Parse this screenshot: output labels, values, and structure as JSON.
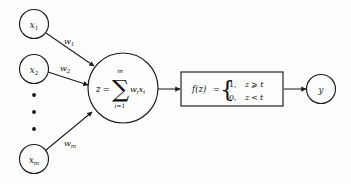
{
  "diagram": {
    "background_color": "#fdfdfd",
    "stroke_color": "#1b1b1b",
    "inputs": [
      {
        "label": "x",
        "subscript": "1",
        "weight": "w",
        "weight_subscript": "1"
      },
      {
        "label": "x",
        "subscript": "2",
        "weight": "w",
        "weight_subscript": "2"
      },
      {
        "label": "x",
        "subscript": "m",
        "weight": "w",
        "weight_subscript": "m"
      }
    ],
    "ellipsis": {
      "name": "vertical-ellipsis",
      "dot_count": 3
    },
    "summation": {
      "lhs": "z",
      "equals": "=",
      "sigma": "∑",
      "upper_limit": "m",
      "lower_limit": "i=1",
      "term_w": "w",
      "term_w_sub": "i",
      "term_x": "x",
      "term_x_sub": "i"
    },
    "activation": {
      "function_name": "f",
      "argument": "(z)",
      "equals": "=",
      "brace": "{",
      "cases": [
        {
          "value": "1,",
          "condition_var": "z",
          "operator": "⩾",
          "threshold": "t"
        },
        {
          "value": "0,",
          "condition_var": "z",
          "operator": "<",
          "threshold": "t"
        }
      ]
    },
    "output": {
      "label": "y"
    }
  }
}
